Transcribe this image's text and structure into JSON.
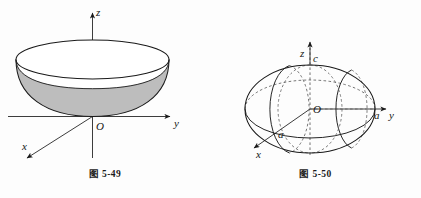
{
  "page": {
    "background_color": "#fdfdfd",
    "ink_color": "#1a1a1a",
    "figure_count": 2
  },
  "figures": [
    {
      "id": "fig-5-49",
      "caption": "图 5-49",
      "surface": "paraboloid-bowl",
      "fill_color": "#bdbdbd",
      "rim_fill_color": "#ffffff",
      "stroke_color": "#1a1a1a",
      "axes": [
        {
          "name": "z-axis",
          "label": "z",
          "direction": "up",
          "arrow": true
        },
        {
          "name": "y-axis",
          "label": "y",
          "direction": "right",
          "arrow": true
        },
        {
          "name": "x-axis",
          "label": "x",
          "direction": "lower-left",
          "arrow": true
        }
      ],
      "points": [
        {
          "name": "origin",
          "label": "O"
        }
      ],
      "hidden_line_style": "dashed"
    },
    {
      "id": "fig-5-50",
      "caption": "图 5-50",
      "surface": "ellipsoid",
      "fill_color": "none",
      "stroke_color": "#1a1a1a",
      "axes": [
        {
          "name": "z-axis",
          "label": "z",
          "direction": "up",
          "arrow": true
        },
        {
          "name": "y-axis",
          "label": "y",
          "direction": "right",
          "arrow": true
        },
        {
          "name": "x-axis",
          "label": "x",
          "direction": "lower-left",
          "arrow": true
        }
      ],
      "points": [
        {
          "name": "origin",
          "label": "O"
        },
        {
          "name": "z-semi-axis",
          "label": "c"
        },
        {
          "name": "y-semi-axis",
          "label": "a"
        },
        {
          "name": "x-semi-axis",
          "label": "a"
        }
      ],
      "hidden_line_style": "dashed"
    }
  ],
  "labels": {
    "fig49": {
      "z": "z",
      "y": "y",
      "x": "x",
      "origin": "O",
      "caption": "图 5-49"
    },
    "fig50": {
      "z": "z",
      "c": "c",
      "y": "y",
      "a_y": "a",
      "a_x": "a",
      "x": "x",
      "origin": "O",
      "caption": "图 5-50"
    }
  }
}
